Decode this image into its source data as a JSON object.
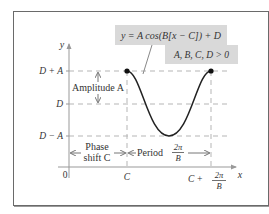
{
  "equation_box": {
    "text": "y = A cos(B[x − C]) + D",
    "condition": "A, B, C, D > 0"
  },
  "axes": {
    "x_label": "x",
    "y_label": "y",
    "origin_label": "0"
  },
  "y_ticks": {
    "top": "D + A",
    "mid": "D",
    "bottom": "D − A"
  },
  "x_ticks": {
    "c": "C",
    "c_plus_period_prefix": "C +",
    "two_pi": "2π",
    "b": "B"
  },
  "annotations": {
    "amplitude": "Amplitude A",
    "phase_shift_line1": "Phase",
    "phase_shift_line2": "shift C",
    "period_prefix": "Period",
    "period_num": "2π",
    "period_den": "B"
  },
  "colors": {
    "curve": "#222222",
    "dashed": "#b0b0b0",
    "axis": "#9a9a9a",
    "label_box": "#d9d9d9"
  }
}
